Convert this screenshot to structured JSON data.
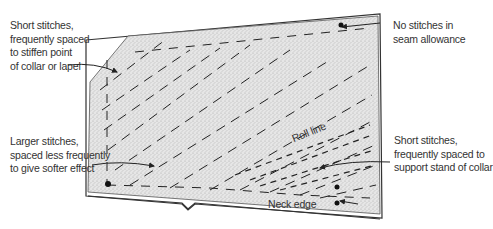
{
  "diagram": {
    "labels": {
      "top_left": [
        "Short stitches,",
        "frequently spaced",
        "to stiffen point",
        "of collar or lapel"
      ],
      "top_right": [
        "No stitches in",
        "seam allowance"
      ],
      "mid_left": [
        "Larger stitches,",
        "spaced less frequently",
        "to give softer effect"
      ],
      "mid_right": [
        "Short stitches,",
        "frequently spaced to",
        "support stand of collar"
      ],
      "roll_line": "Roll line",
      "neck_edge": "Neck edge"
    },
    "colors": {
      "fabric_fill": "#d9d9d9",
      "outline": "#333333",
      "text": "#333333"
    }
  }
}
